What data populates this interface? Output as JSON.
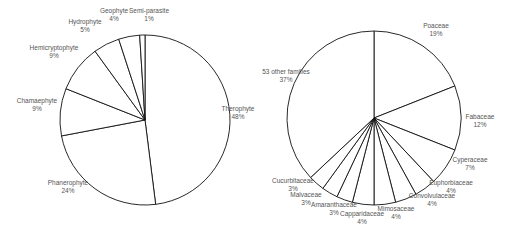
{
  "chart_data": [
    {
      "type": "pie",
      "title": "",
      "center": [
        145,
        120
      ],
      "radius": 85,
      "start_angle_deg": 0,
      "direction": "clockwise",
      "slices": [
        {
          "label": "Therophyte",
          "value": 48,
          "pct_label": "48%",
          "lx": 238,
          "ly": 113
        },
        {
          "label": "Phanerophyte",
          "value": 24,
          "pct_label": "24%",
          "lx": 68,
          "ly": 187
        },
        {
          "label": "Chamaephyte",
          "value": 9,
          "pct_label": "9%",
          "lx": 37,
          "ly": 105
        },
        {
          "label": "Hemicryptophyte",
          "value": 9,
          "pct_label": "9%",
          "lx": 54,
          "ly": 52
        },
        {
          "label": "Hydrophyte",
          "value": 5,
          "pct_label": "5%",
          "lx": 85,
          "ly": 26
        },
        {
          "label": "Geophyte",
          "value": 4,
          "pct_label": "4%",
          "lx": 114,
          "ly": 15
        },
        {
          "label": "Semi-parasite",
          "value": 1,
          "pct_label": "1%",
          "lx": 149,
          "ly": 15
        }
      ]
    },
    {
      "type": "pie",
      "title": "",
      "center": [
        374,
        118
      ],
      "radius": 87,
      "start_angle_deg": 0,
      "direction": "clockwise",
      "slices": [
        {
          "label": "Poaceae",
          "value": 19,
          "pct_label": "19%",
          "lx": 436,
          "ly": 30
        },
        {
          "label": "Fabaceae",
          "value": 12,
          "pct_label": "12%",
          "lx": 480,
          "ly": 121
        },
        {
          "label": "Cyperaceae",
          "value": 7,
          "pct_label": "7%",
          "lx": 470,
          "ly": 164
        },
        {
          "label": "Euphorbiaceae",
          "value": 4,
          "pct_label": "4%",
          "lx": 451,
          "ly": 187
        },
        {
          "label": "Convolvulaceae",
          "value": 4,
          "pct_label": "4%",
          "lx": 432,
          "ly": 200
        },
        {
          "label": "Mimosaceae",
          "value": 4,
          "pct_label": "4%",
          "lx": 396,
          "ly": 213
        },
        {
          "label": "Capparidaceae",
          "value": 4,
          "pct_label": "4%",
          "lx": 362,
          "ly": 218
        },
        {
          "label": "Amaranthaceae",
          "value": 3,
          "pct_label": "3%",
          "lx": 334,
          "ly": 209
        },
        {
          "label": "Malvaceae",
          "value": 3,
          "pct_label": "3%",
          "lx": 306,
          "ly": 199
        },
        {
          "label": "Cucurbitaceae",
          "value": 3,
          "pct_label": "3%",
          "lx": 293,
          "ly": 185
        },
        {
          "label": "53 other families",
          "value": 37,
          "pct_label": "37%",
          "lx": 286,
          "ly": 76
        }
      ]
    }
  ]
}
